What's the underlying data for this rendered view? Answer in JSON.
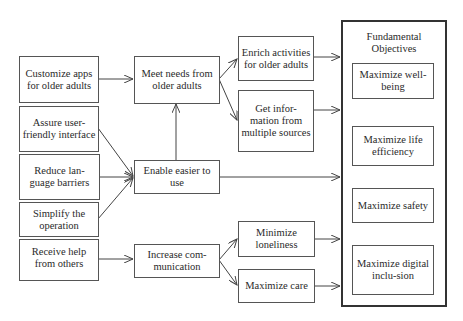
{
  "diagram": {
    "type": "objectives-network",
    "means_objectives": {
      "customize": "Customize apps for older adults",
      "assure": "Assure user-friendly interface",
      "reduce": "Reduce lan-guage barriers",
      "simplify": "Simplify the operation",
      "receive": "Receive help from others"
    },
    "intermediate": {
      "meet_needs": "Meet needs from older adults",
      "enable": "Enable easier to use",
      "increase": "Increase com-munication"
    },
    "sub_objectives": {
      "enrich": "Enrich activities for older adults",
      "get_info": "Get infor-mation from multiple sources",
      "minimize_lonely": "Minimize loneliness",
      "max_care": "Maximize care"
    },
    "fundamental": {
      "title": "Fundamental Objectives",
      "items": [
        "Maximize well-being",
        "Maximize life efficiency",
        "Maximize safety",
        "Maximize digital inclu-sion"
      ]
    },
    "edges": [
      [
        "Customize apps for older adults",
        "Meet needs from older adults"
      ],
      [
        "Assure user-friendly interface",
        "Enable easier to use"
      ],
      [
        "Reduce language barriers",
        "Enable easier to use"
      ],
      [
        "Simplify the operation",
        "Enable easier to use"
      ],
      [
        "Enable easier to use",
        "Meet needs from older adults"
      ],
      [
        "Enable easier to use",
        "Fundamental Objectives"
      ],
      [
        "Receive help from others",
        "Increase communication"
      ],
      [
        "Meet needs from older adults",
        "Enrich activities for older adults"
      ],
      [
        "Meet needs from older adults",
        "Get information from multiple sources"
      ],
      [
        "Increase communication",
        "Minimize loneliness"
      ],
      [
        "Increase communication",
        "Maximize care"
      ],
      [
        "Enrich activities for older adults",
        "Fundamental Objectives"
      ],
      [
        "Get information from multiple sources",
        "Fundamental Objectives"
      ],
      [
        "Minimize loneliness",
        "Fundamental Objectives"
      ],
      [
        "Maximize care",
        "Fundamental Objectives"
      ]
    ]
  }
}
